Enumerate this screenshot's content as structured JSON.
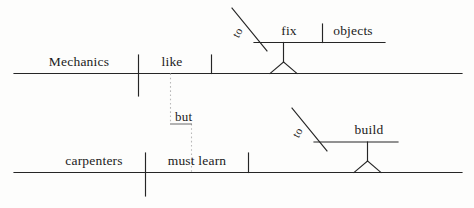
{
  "diagram": {
    "type": "reed-kellogg-sentence-diagram",
    "sentence": "Mechanics like to fix objects, but carpenters must learn to build.",
    "ink_color": "#262626",
    "background_color": "#fdfdfc",
    "clauses": [
      {
        "id": "clause-top",
        "subject": "Mechanics",
        "verb": "like",
        "object_phrase": {
          "preposition_marker": "to",
          "verb": "fix",
          "object": "objects"
        }
      },
      {
        "id": "clause-bottom",
        "subject": "carpenters",
        "verb": "must learn",
        "object_phrase": {
          "preposition_marker": "to",
          "verb": "build",
          "object": ""
        }
      }
    ],
    "conjunction": {
      "label": "but",
      "style": "dotted-connector"
    },
    "words": {
      "mechanics": "Mechanics",
      "like": "like",
      "to_top": "to",
      "fix": "fix",
      "objects": "objects",
      "but": "but",
      "carpenters": "carpenters",
      "must_learn": "must learn",
      "to_bottom": "to",
      "build": "build"
    }
  }
}
